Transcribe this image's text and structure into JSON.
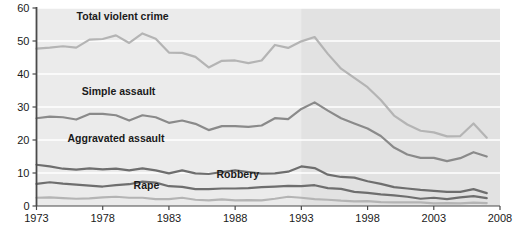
{
  "chart_data": {
    "type": "line",
    "title": "",
    "subtitle": "",
    "xlabel": "",
    "ylabel": "",
    "xlim": [
      1973,
      2008
    ],
    "ylim": [
      0,
      60
    ],
    "grid": "horizontal",
    "legend_position": "inline-labels",
    "x_ticks": [
      "1973",
      "1978",
      "1983",
      "1988",
      "1993",
      "1998",
      "2003",
      "2008"
    ],
    "x_tick_values": [
      1973,
      1978,
      1983,
      1988,
      1993,
      1998,
      2003,
      2008
    ],
    "y_ticks": [
      "0",
      "10",
      "20",
      "30",
      "40",
      "50",
      "60"
    ],
    "y_tick_values": [
      0,
      10,
      20,
      30,
      40,
      50,
      60
    ],
    "x": [
      1973,
      1974,
      1975,
      1976,
      1977,
      1978,
      1979,
      1980,
      1981,
      1982,
      1983,
      1984,
      1985,
      1986,
      1987,
      1988,
      1989,
      1990,
      1991,
      1992,
      1993,
      1994,
      1995,
      1996,
      1997,
      1998,
      1999,
      2000,
      2001,
      2002,
      2003,
      2004,
      2005,
      2006,
      2007
    ],
    "shaded_region": {
      "from": 1993,
      "to": 2008,
      "color": "#e2e2e2",
      "note": "shaded band covering 1993 onward"
    },
    "series": [
      {
        "name": "Total violent crime",
        "color": "#b4b4b4",
        "label_x": 1979.5,
        "label_y": 56.5,
        "values": [
          47.7,
          48.0,
          48.4,
          48.0,
          50.4,
          50.6,
          51.7,
          49.4,
          52.3,
          50.7,
          46.5,
          46.4,
          45.2,
          42.0,
          44.0,
          44.1,
          43.3,
          44.1,
          48.8,
          47.9,
          49.9,
          51.2,
          46.1,
          41.6,
          38.8,
          36.0,
          32.1,
          27.4,
          24.7,
          22.8,
          22.3,
          21.1,
          21.2,
          25.0,
          20.7
        ]
      },
      {
        "name": "Simple assault",
        "color": "#8a8a8a",
        "label_x": 1979.2,
        "label_y": 33.5,
        "values": [
          26.6,
          27.1,
          26.9,
          26.2,
          27.9,
          27.9,
          27.5,
          25.9,
          27.5,
          26.9,
          25.2,
          25.9,
          24.9,
          23.0,
          24.2,
          24.2,
          24.0,
          24.4,
          26.6,
          26.3,
          29.4,
          31.4,
          28.9,
          26.6,
          25.0,
          23.5,
          21.2,
          17.7,
          15.6,
          14.6,
          14.6,
          13.6,
          14.5,
          16.3,
          15.0
        ]
      },
      {
        "name": "Aggravated assault",
        "color": "#6e6e6e",
        "label_x": 1979.0,
        "label_y": 19.5,
        "values": [
          12.5,
          12.0,
          11.3,
          11.0,
          11.4,
          11.1,
          11.3,
          10.8,
          11.4,
          10.8,
          9.9,
          10.8,
          9.9,
          9.7,
          10.3,
          10.8,
          10.3,
          9.8,
          9.9,
          10.4,
          12.0,
          11.5,
          9.5,
          8.8,
          8.6,
          7.5,
          6.7,
          5.7,
          5.3,
          4.9,
          4.6,
          4.3,
          4.3,
          5.1,
          3.9
        ]
      },
      {
        "name": "Robbery",
        "color": "#6e6e6e",
        "label_x": 1988.2,
        "label_y": 8.5,
        "values": [
          6.7,
          7.2,
          6.8,
          6.5,
          6.2,
          5.9,
          6.3,
          6.6,
          7.4,
          7.1,
          6.0,
          5.8,
          5.1,
          5.1,
          5.3,
          5.3,
          5.4,
          5.7,
          5.9,
          6.1,
          6.0,
          6.3,
          5.4,
          5.2,
          4.3,
          4.0,
          3.5,
          3.2,
          2.8,
          2.2,
          2.5,
          2.1,
          2.6,
          3.0,
          2.4
        ]
      },
      {
        "name": "Rape",
        "color": "#b4b4b4",
        "label_x": 1981.3,
        "label_y": 5.2,
        "values": [
          2.5,
          2.6,
          2.4,
          2.2,
          2.3,
          2.6,
          2.8,
          2.5,
          2.5,
          2.1,
          2.1,
          2.5,
          1.9,
          1.7,
          2.0,
          1.7,
          1.8,
          1.7,
          2.2,
          2.8,
          2.5,
          2.1,
          1.9,
          1.6,
          1.4,
          1.5,
          1.2,
          1.1,
          1.1,
          1.1,
          0.8,
          0.9,
          0.8,
          1.0,
          0.9
        ]
      }
    ]
  },
  "axis": {
    "axis_color": "#4a4a4a",
    "gridline_color": "#ffffff",
    "plot_background": "#ebebeb",
    "plot_background_shaded": "#e0e0e0"
  }
}
